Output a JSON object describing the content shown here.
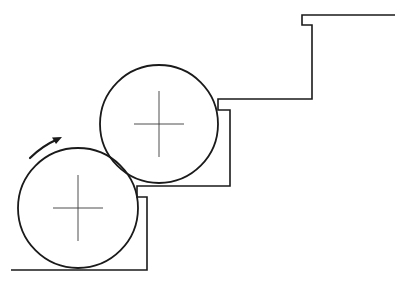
{
  "diagram": {
    "colors": {
      "stroke": "#1a1a1a",
      "background": "#ffffff"
    },
    "rollers": [
      {
        "id": "lower-roller",
        "cx": 78,
        "cy": 208,
        "r": 60,
        "centerline_half": 25
      },
      {
        "id": "upper-roller",
        "cx": 159,
        "cy": 124,
        "r": 59,
        "centerline_half": 25
      }
    ],
    "stepped_profile": {
      "points": "11,270 147,270 147,197 137,197 137,186 230,186 230,110 218,110 218,99 312,99 312,25 302,25 302,15 395,15"
    },
    "rotation_arrow": {
      "direction": "clockwise",
      "path": "M 30 158 Q 42 146 58 139"
    }
  }
}
